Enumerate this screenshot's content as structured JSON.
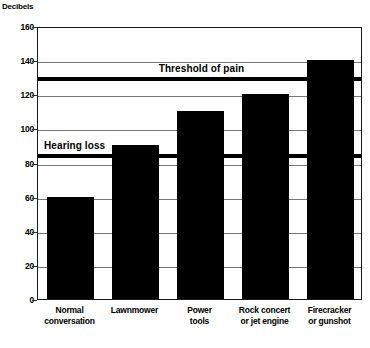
{
  "chart_data": {
    "type": "bar",
    "title": "",
    "xlabel": "",
    "ylabel": "Decibels",
    "ylim": [
      0,
      160
    ],
    "yticks": [
      0,
      20,
      40,
      60,
      80,
      100,
      120,
      140,
      160
    ],
    "grid": true,
    "legend": "none",
    "categories": [
      "Normal\nconversation",
      "Lawnmower",
      "Power\ntools",
      "Rock concert\nor jet engine",
      "Firecracker\nor gunshot"
    ],
    "values": [
      60,
      90,
      110,
      120,
      140
    ],
    "bar_color": "#000000",
    "annotations": [
      {
        "label": "Hearing loss",
        "value": 85,
        "style": "horizontal-rule"
      },
      {
        "label": "Threshold of pain",
        "value": 130,
        "style": "horizontal-rule"
      }
    ]
  },
  "axis": {
    "y_title": "Decibels",
    "ticks": [
      {
        "label": "160",
        "value": 160
      },
      {
        "label": "140",
        "value": 140
      },
      {
        "label": "120",
        "value": 120
      },
      {
        "label": "100",
        "value": 100
      },
      {
        "label": "80",
        "value": 80
      },
      {
        "label": "60",
        "value": 60
      },
      {
        "label": "40",
        "value": 40
      },
      {
        "label": "20",
        "value": 20
      },
      {
        "label": "0",
        "value": 0
      }
    ]
  },
  "bars": [
    {
      "label": "Normal\nconversation",
      "value": 60
    },
    {
      "label": "Lawnmower",
      "value": 90
    },
    {
      "label": "Power\ntools",
      "value": 110
    },
    {
      "label": "Rock concert\nor jet engine",
      "value": 120
    },
    {
      "label": "Firecracker\nor gunshot",
      "value": 140
    }
  ],
  "reference_lines": [
    {
      "label": "Hearing loss",
      "value": 85
    },
    {
      "label": "Threshold of pain",
      "value": 130
    }
  ],
  "colors": {
    "bar": "#000000",
    "frame": "#1a1a1a",
    "grid": "#777777",
    "background": "#ffffff"
  }
}
